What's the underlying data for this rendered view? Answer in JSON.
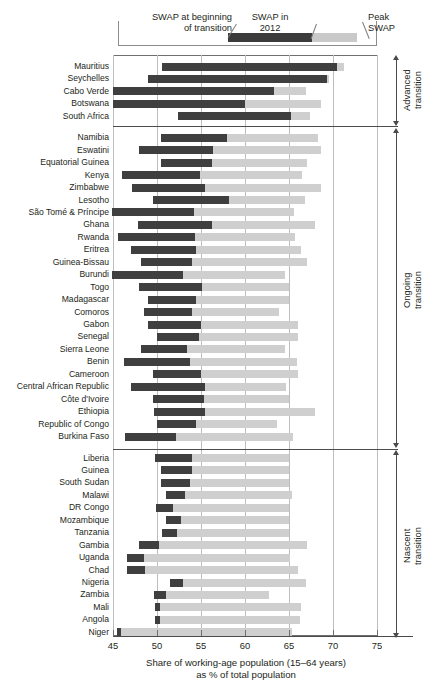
{
  "legend": {
    "items": [
      {
        "key": "swap-begin",
        "label": "SWAP at beginning\nof transition",
        "color": "#ffffff"
      },
      {
        "key": "swap-2012",
        "label": "SWAP in\n2012",
        "color": "#3b3b3b"
      },
      {
        "key": "swap-peak",
        "label": "Peak\nSWAP",
        "color": "#c9c9c9"
      }
    ]
  },
  "axis": {
    "title_line1": "Share of working-age population (15–64 years)",
    "title_line2": "as % of total population",
    "ticks": [
      45,
      50,
      55,
      60,
      65,
      70,
      75
    ],
    "tick_labels": [
      "45",
      "50",
      "55",
      "60",
      "65",
      "70",
      "75"
    ]
  },
  "groups": [
    {
      "name": "advanced",
      "label": "Advanced\ntransition",
      "count": 5
    },
    {
      "name": "ongoing",
      "label": "Ongoing\ntransition",
      "count": 23
    },
    {
      "name": "nascent",
      "label": "Nascent\ntransition",
      "count": 14
    }
  ],
  "chart_data": {
    "type": "bar",
    "orientation": "horizontal",
    "title": "",
    "xlabel": "Share of working-age population (15–64 years) as % of total population",
    "ylabel": "",
    "xlim": [
      45,
      77
    ],
    "grid": true,
    "legend_position": "top",
    "series": [
      {
        "name": "SWAP at beginning of transition",
        "role": "bar_start",
        "color": "#ffffff"
      },
      {
        "name": "SWAP in 2012",
        "role": "dark_end",
        "color": "#3f3f3f"
      },
      {
        "name": "Peak SWAP",
        "role": "light_end",
        "color": "#cfcfcf"
      }
    ],
    "categories": [
      "Mauritius",
      "Seychelles",
      "Cabo Verde",
      "Botswana",
      "South Africa",
      "Namibia",
      "Eswatini",
      "Equatorial Guinea",
      "Kenya",
      "Zimbabwe",
      "Lesotho",
      "São Tomé & Príncipe",
      "Ghana",
      "Rwanda",
      "Eritrea",
      "Guinea-Bissau",
      "Burundi",
      "Togo",
      "Madagascar",
      "Comoros",
      "Gabon",
      "Senegal",
      "Sierra Leone",
      "Benin",
      "Cameroon",
      "Central African Republic",
      "Côte d'Ivoire",
      "Ethiopia",
      "Republic of Congo",
      "Burkina Faso",
      "Liberia",
      "Guinea",
      "South Sudan",
      "Malawi",
      "DR Congo",
      "Mozambique",
      "Tanzania",
      "Gambia",
      "Uganda",
      "Chad",
      "Nigeria",
      "Zambia",
      "Mali",
      "Angola",
      "Niger"
    ],
    "rows": [
      {
        "country": "Mauritius",
        "group": "advanced",
        "swap_begin": 50.6,
        "swap_2012": 70.5,
        "swap_peak": 71.2
      },
      {
        "country": "Seychelles",
        "group": "advanced",
        "swap_begin": 49.0,
        "swap_2012": 69.3,
        "swap_peak": 69.6
      },
      {
        "country": "Cabo Verde",
        "group": "advanced",
        "swap_begin": 45.0,
        "swap_2012": 63.3,
        "swap_peak": 66.9
      },
      {
        "country": "Botswana",
        "group": "advanced",
        "swap_begin": 45.0,
        "swap_2012": 60.0,
        "swap_peak": 68.6
      },
      {
        "country": "South Africa",
        "group": "advanced",
        "swap_begin": 52.4,
        "swap_2012": 65.2,
        "swap_peak": 67.4
      },
      {
        "country": "Namibia",
        "group": "ongoing",
        "swap_begin": 50.4,
        "swap_2012": 57.9,
        "swap_peak": 68.3
      },
      {
        "country": "Eswatini",
        "group": "ongoing",
        "swap_begin": 48.0,
        "swap_2012": 56.4,
        "swap_peak": 68.6
      },
      {
        "country": "Equatorial Guinea",
        "group": "ongoing",
        "swap_begin": 50.5,
        "swap_2012": 56.2,
        "swap_peak": 67.1
      },
      {
        "country": "Kenya",
        "group": "ongoing",
        "swap_begin": 46.0,
        "swap_2012": 54.9,
        "swap_peak": 66.5
      },
      {
        "country": "Zimbabwe",
        "group": "ongoing",
        "swap_begin": 47.2,
        "swap_2012": 55.5,
        "swap_peak": 68.6
      },
      {
        "country": "Lesotho",
        "group": "ongoing",
        "swap_begin": 49.6,
        "swap_2012": 58.2,
        "swap_peak": 66.8
      },
      {
        "country": "São Tomé & Príncipe",
        "group": "ongoing",
        "swap_begin": 44.9,
        "swap_2012": 54.2,
        "swap_peak": 65.6
      },
      {
        "country": "Ghana",
        "group": "ongoing",
        "swap_begin": 47.8,
        "swap_2012": 56.3,
        "swap_peak": 68.0
      },
      {
        "country": "Rwanda",
        "group": "ongoing",
        "swap_begin": 45.6,
        "swap_2012": 54.3,
        "swap_peak": 65.7
      },
      {
        "country": "Eritrea",
        "group": "ongoing",
        "swap_begin": 47.0,
        "swap_2012": 54.4,
        "swap_peak": 66.4
      },
      {
        "country": "Guinea-Bissau",
        "group": "ongoing",
        "swap_begin": 48.2,
        "swap_2012": 54.0,
        "swap_peak": 67.0
      },
      {
        "country": "Burundi",
        "group": "ongoing",
        "swap_begin": 44.9,
        "swap_2012": 53.0,
        "swap_peak": 64.5
      },
      {
        "country": "Togo",
        "group": "ongoing",
        "swap_begin": 48.0,
        "swap_2012": 55.1,
        "swap_peak": 65.0
      },
      {
        "country": "Madagascar",
        "group": "ongoing",
        "swap_begin": 49.0,
        "swap_2012": 54.4,
        "swap_peak": 65.0
      },
      {
        "country": "Comoros",
        "group": "ongoing",
        "swap_begin": 48.5,
        "swap_2012": 54.0,
        "swap_peak": 63.9
      },
      {
        "country": "Gabon",
        "group": "ongoing",
        "swap_begin": 49.0,
        "swap_2012": 55.0,
        "swap_peak": 66.0
      },
      {
        "country": "Senegal",
        "group": "ongoing",
        "swap_begin": 50.0,
        "swap_2012": 54.8,
        "swap_peak": 66.0
      },
      {
        "country": "Sierra Leone",
        "group": "ongoing",
        "swap_begin": 48.2,
        "swap_2012": 53.4,
        "swap_peak": 64.6
      },
      {
        "country": "Benin",
        "group": "ongoing",
        "swap_begin": 46.3,
        "swap_2012": 53.7,
        "swap_peak": 65.9
      },
      {
        "country": "Cameroon",
        "group": "ongoing",
        "swap_begin": 49.5,
        "swap_2012": 55.0,
        "swap_peak": 66.0
      },
      {
        "country": "Central African Republic",
        "group": "ongoing",
        "swap_begin": 47.0,
        "swap_2012": 55.5,
        "swap_peak": 64.7
      },
      {
        "country": "Côte d'Ivoire",
        "group": "ongoing",
        "swap_begin": 49.5,
        "swap_2012": 55.3,
        "swap_peak": 65.0
      },
      {
        "country": "Ethiopia",
        "group": "ongoing",
        "swap_begin": 49.7,
        "swap_2012": 55.4,
        "swap_peak": 67.9
      },
      {
        "country": "Republic of Congo",
        "group": "ongoing",
        "swap_begin": 50.0,
        "swap_2012": 54.4,
        "swap_peak": 63.6
      },
      {
        "country": "Burkina Faso",
        "group": "ongoing",
        "swap_begin": 46.4,
        "swap_2012": 52.2,
        "swap_peak": 65.5
      },
      {
        "country": "Liberia",
        "group": "nascent",
        "swap_begin": 49.8,
        "swap_2012": 54.0,
        "swap_peak": 65.0
      },
      {
        "country": "Guinea",
        "group": "nascent",
        "swap_begin": 50.5,
        "swap_2012": 54.0,
        "swap_peak": 65.0
      },
      {
        "country": "South Sudan",
        "group": "nascent",
        "swap_begin": 50.4,
        "swap_2012": 53.8,
        "swap_peak": 65.0
      },
      {
        "country": "Malawi",
        "group": "nascent",
        "swap_begin": 51.0,
        "swap_2012": 53.2,
        "swap_peak": 65.3
      },
      {
        "country": "DR Congo",
        "group": "nascent",
        "swap_begin": 49.9,
        "swap_2012": 51.8,
        "swap_peak": 65.0
      },
      {
        "country": "Mozambique",
        "group": "nascent",
        "swap_begin": 51.0,
        "swap_2012": 52.7,
        "swap_peak": 65.0
      },
      {
        "country": "Tanzania",
        "group": "nascent",
        "swap_begin": 50.6,
        "swap_2012": 52.3,
        "swap_peak": 65.0
      },
      {
        "country": "Gambia",
        "group": "nascent",
        "swap_begin": 48.0,
        "swap_2012": 50.2,
        "swap_peak": 67.1
      },
      {
        "country": "Uganda",
        "group": "nascent",
        "swap_begin": 46.6,
        "swap_2012": 48.5,
        "swap_peak": 65.1
      },
      {
        "country": "Chad",
        "group": "nascent",
        "swap_begin": 46.6,
        "swap_2012": 48.6,
        "swap_peak": 66.0
      },
      {
        "country": "Nigeria",
        "group": "nascent",
        "swap_begin": 51.5,
        "swap_2012": 52.9,
        "swap_peak": 66.9
      },
      {
        "country": "Zambia",
        "group": "nascent",
        "swap_begin": 49.7,
        "swap_2012": 51.0,
        "swap_peak": 62.7
      },
      {
        "country": "Mali",
        "group": "nascent",
        "swap_begin": 49.8,
        "swap_2012": 50.3,
        "swap_peak": 66.4
      },
      {
        "country": "Angola",
        "group": "nascent",
        "swap_begin": 49.8,
        "swap_2012": 50.3,
        "swap_peak": 66.3
      },
      {
        "country": "Niger",
        "group": "nascent",
        "swap_begin": 45.5,
        "swap_2012": 45.9,
        "swap_peak": 65.3
      }
    ]
  }
}
